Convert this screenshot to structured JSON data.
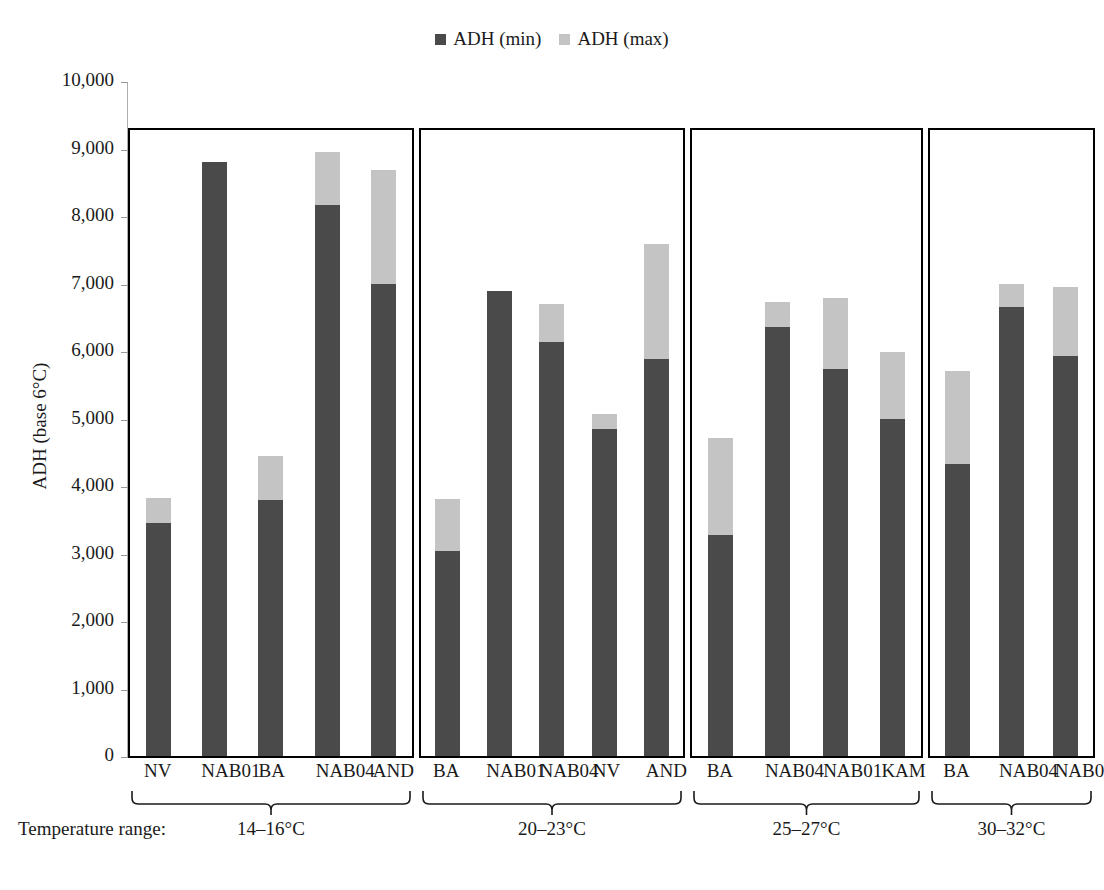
{
  "legend": {
    "items": [
      {
        "label": "ADH (min)",
        "color": "#4a4a4a"
      },
      {
        "label": "ADH (max)",
        "color": "#c4c4c4"
      }
    ]
  },
  "axis": {
    "y_title": "ADH (base 6°C)",
    "y_ticks": [
      "10,000",
      "9,000",
      "8,000",
      "7,000",
      "6,000",
      "5,000",
      "4,000",
      "3,000",
      "2,000",
      "1,000",
      "0"
    ]
  },
  "footer": {
    "temp_range_caption": "Temperature range:"
  },
  "chart_data": {
    "type": "bar",
    "subtype": "stacked-grouped-panels",
    "title": "",
    "xlabel": "Temperature range:",
    "ylabel": "ADH (base 6°C)",
    "ylim": [
      0,
      10000
    ],
    "ytick_step": 1000,
    "grid": false,
    "legend_position": "top-center",
    "series": [
      {
        "name": "ADH (min)",
        "color": "#4a4a4a"
      },
      {
        "name": "ADH (max)",
        "color": "#c4c4c4"
      }
    ],
    "panels": [
      {
        "range_label": "14–16°C",
        "categories": [
          "NV",
          "NAB01",
          "BA",
          "NAB04",
          "AND"
        ],
        "adh_min": [
          3450,
          8800,
          3800,
          8160,
          7000
        ],
        "adh_max": [
          3820,
          8800,
          4440,
          8950,
          8680
        ]
      },
      {
        "range_label": "20–23°C",
        "categories": [
          "BA",
          "NAB01",
          "NAB04",
          "NV",
          "AND"
        ],
        "adh_min": [
          3030,
          6890,
          6140,
          4840,
          5880
        ],
        "adh_max": [
          3810,
          6890,
          6700,
          5070,
          7590
        ]
      },
      {
        "range_label": "25–27°C",
        "categories": [
          "BA",
          "NAB04",
          "NAB01",
          "KAM"
        ],
        "adh_min": [
          3270,
          6350,
          5740,
          5000
        ],
        "adh_max": [
          4710,
          6720,
          6780,
          5980
        ]
      },
      {
        "range_label": "30–32°C",
        "categories": [
          "BA",
          "NAB04",
          "NAB01"
        ],
        "adh_min": [
          4330,
          6650,
          5930
        ],
        "adh_max": [
          5710,
          7000,
          6950
        ]
      }
    ]
  }
}
